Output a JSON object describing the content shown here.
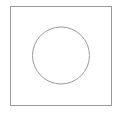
{
  "canvas": {
    "width": 122,
    "height": 113,
    "background": "#ffffff"
  },
  "shapes": {
    "square": {
      "x": 10.5,
      "y": 6.5,
      "width": 101,
      "height": 99,
      "stroke": "#9a9a9a",
      "stroke_width": 1
    },
    "circle": {
      "cx": 61,
      "cy": 55.5,
      "r": 28.5,
      "stroke": "#9a9a9a",
      "stroke_width": 1
    }
  }
}
